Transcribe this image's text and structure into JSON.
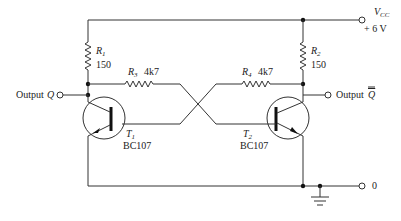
{
  "supply": {
    "label": "V",
    "label_sub": "CC",
    "value": "+ 6 V"
  },
  "ground_terminal": {
    "label": "0"
  },
  "outputs": [
    {
      "label": "Output",
      "symbol": "Q"
    },
    {
      "label": "Output",
      "symbol": "Q"
    }
  ],
  "resistors": [
    {
      "ref": "R",
      "ref_sub": "1",
      "value": "150"
    },
    {
      "ref": "R",
      "ref_sub": "2",
      "value": "150"
    },
    {
      "ref": "R",
      "ref_sub": "3",
      "value": "4k7"
    },
    {
      "ref": "R",
      "ref_sub": "4",
      "value": "4k7"
    }
  ],
  "transistors": [
    {
      "ref": "T",
      "ref_sub": "1",
      "part": "BC107",
      "type": "NPN"
    },
    {
      "ref": "T",
      "ref_sub": "2",
      "part": "BC107",
      "type": "NPN"
    }
  ],
  "colors": {
    "wire": "#333333",
    "background": "#ffffff"
  }
}
